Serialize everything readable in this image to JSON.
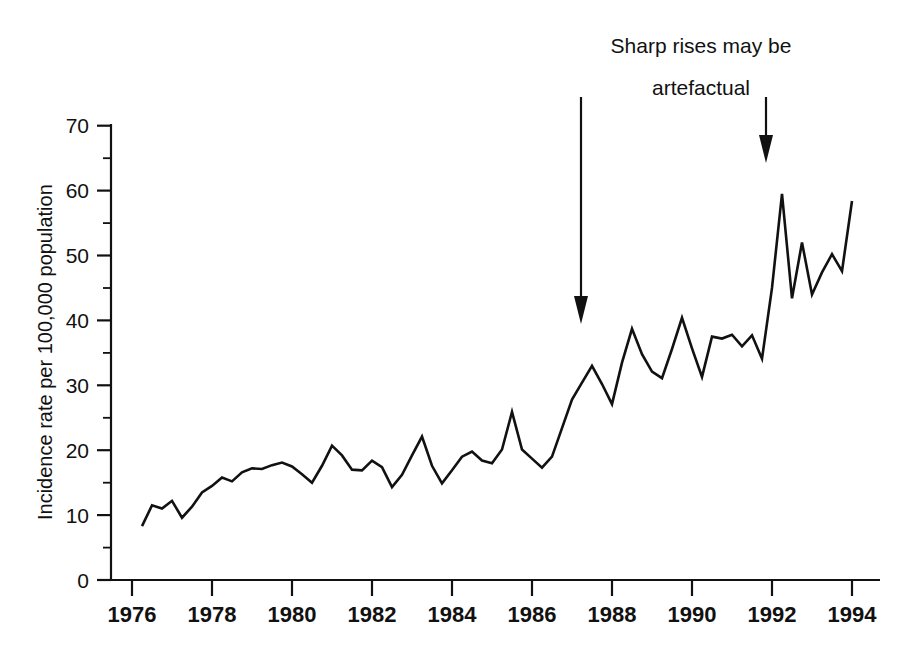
{
  "chart_data": {
    "type": "line",
    "title": "",
    "xlabel": "",
    "ylabel": "Incidence rate per 100,000 population",
    "xlim": [
      1976,
      1994
    ],
    "ylim": [
      0,
      70
    ],
    "grid": false,
    "legend": null,
    "y_ticks": [
      0,
      10,
      20,
      30,
      40,
      50,
      60,
      70
    ],
    "y_tick_labels": [
      "0",
      "10",
      "20",
      "30",
      "40",
      "50",
      "60",
      "70"
    ],
    "y_minor_ticks": [
      5,
      15,
      25,
      35,
      45,
      55,
      65
    ],
    "x_ticks": [
      1976,
      1978,
      1980,
      1982,
      1984,
      1986,
      1988,
      1990,
      1992,
      1994
    ],
    "x_tick_labels": [
      "1976",
      "1978",
      "1980",
      "1982",
      "1984",
      "1986",
      "1988",
      "1990",
      "1992",
      "1994"
    ],
    "series": [
      {
        "name": "Incidence rate",
        "color": "#111111",
        "x": [
          1976.25,
          1976.5,
          1976.75,
          1977.0,
          1977.25,
          1977.5,
          1977.75,
          1978.0,
          1978.25,
          1978.5,
          1978.75,
          1979.0,
          1979.25,
          1979.5,
          1979.75,
          1980.0,
          1980.25,
          1980.5,
          1980.75,
          1981.0,
          1981.25,
          1981.5,
          1981.75,
          1982.0,
          1982.25,
          1982.5,
          1982.75,
          1983.0,
          1983.25,
          1983.5,
          1983.75,
          1984.0,
          1984.25,
          1984.5,
          1984.75,
          1985.0,
          1985.25,
          1985.5,
          1985.75,
          1986.0,
          1986.25,
          1986.5,
          1986.75,
          1987.0,
          1987.25,
          1987.5,
          1987.75,
          1988.0,
          1988.25,
          1988.5,
          1988.75,
          1989.0,
          1989.25,
          1989.5,
          1989.75,
          1990.0,
          1990.25,
          1990.5,
          1990.75,
          1991.0,
          1991.25,
          1991.5,
          1991.75,
          1992.0,
          1992.25,
          1992.5,
          1992.75,
          1993.0,
          1993.25,
          1993.5,
          1993.75,
          1994.0
        ],
        "values": [
          8.3,
          11.5,
          11.0,
          12.2,
          9.6,
          11.3,
          13.5,
          14.5,
          15.8,
          15.2,
          16.6,
          17.2,
          17.1,
          17.7,
          18.1,
          17.5,
          16.3,
          15.0,
          17.6,
          20.7,
          19.2,
          17.0,
          16.9,
          18.4,
          17.4,
          14.3,
          16.2,
          19.2,
          22.1,
          17.6,
          14.9,
          16.9,
          19.0,
          19.8,
          18.4,
          18.0,
          20.1,
          25.9,
          20.1,
          18.7,
          17.3,
          19.0,
          23.4,
          27.8,
          30.4,
          33.0,
          30.2,
          27.1,
          33.5,
          38.7,
          34.8,
          32.1,
          31.1,
          35.6,
          40.4,
          35.7,
          31.3,
          37.5,
          37.2,
          37.8,
          36.0,
          37.7,
          34.1,
          45.0,
          59.5,
          43.4,
          52.0,
          44.0,
          47.4,
          50.2,
          47.6,
          58.4
        ]
      }
    ],
    "annotations": [
      {
        "id": "artefactual-note",
        "lines": [
          "Sharp rises may be",
          "artefactual"
        ],
        "text": "Sharp rises may be artefactual"
      },
      {
        "id": "arrow-left",
        "name": "annotation-arrow-left",
        "points_to_year": 1987.2,
        "top_value": 70,
        "tip_value": 40.5
      },
      {
        "id": "arrow-right",
        "name": "annotation-arrow-right",
        "points_to_year": 1991.8,
        "top_value": 70,
        "tip_value": 64.0
      }
    ]
  },
  "colors": {
    "line": "#111111",
    "axis": "#111111",
    "background": "#ffffff"
  }
}
